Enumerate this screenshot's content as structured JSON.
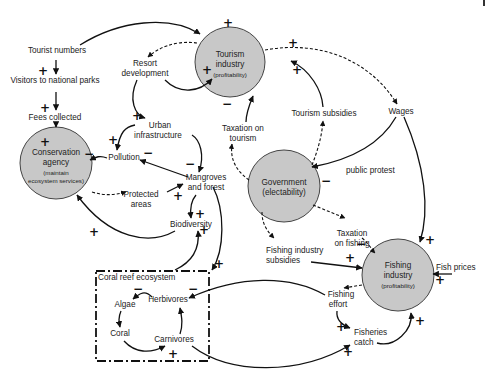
{
  "diagram": {
    "type": "causal-loop-diagram",
    "nodes": {
      "tourist_numbers": "Tourist numbers",
      "visitors_parks": "Visitors to national parks",
      "fees_collected": "Fees collected",
      "resort_development_1": "Resort",
      "resort_development_2": "development",
      "urban_infra_1": "Urban",
      "urban_infra_2": "infrastructure",
      "pollution": "Pollution",
      "mangroves_1": "Mangroves",
      "mangroves_2": "and forest",
      "protected_areas_1": "Protected",
      "protected_areas_2": "areas",
      "biodiversity": "Biodiversity",
      "taxation_tourism_1": "Taxation on",
      "taxation_tourism_2": "tourism",
      "tourism_subsidies": "Tourism subsidies",
      "wages": "Wages",
      "public_protest": "public protest",
      "taxation_fishing_1": "Taxation",
      "taxation_fishing_2": "on fishing",
      "fishing_subsidies_1": "Fishing industry",
      "fishing_subsidies_2": "subsidies",
      "fish_prices": "Fish prices",
      "fishing_effort_1": "Fishing",
      "fishing_effort_2": "effort",
      "fisheries_catch_1": "Fisheries",
      "fisheries_catch_2": "catch",
      "coral_reef_box": "Coral reef ecosystem",
      "algae": "Algae",
      "herbivores": "Herbivores",
      "coral": "Coral",
      "carnivores": "Carnivores"
    },
    "actors": {
      "tourism": {
        "line1": "Tourism",
        "line2": "industry",
        "sub": "(profitability)"
      },
      "conservation": {
        "line1": "Conservation",
        "line2": "agency",
        "sub1": "(maintain",
        "sub2": "ecosystem services)"
      },
      "government": {
        "line1": "Government",
        "line2": "(electability)"
      },
      "fishing": {
        "line1": "Fishing",
        "line2": "industry",
        "sub": "(profitability)"
      }
    },
    "signs": {
      "plus": "+",
      "minus": "−"
    },
    "colors": {
      "actor_fill": "#c8c8c8",
      "actor_stroke": "#444444",
      "line": "#111111"
    }
  }
}
